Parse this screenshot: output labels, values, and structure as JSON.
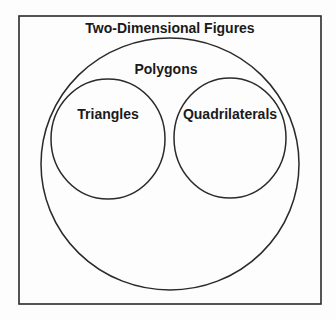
{
  "diagram": {
    "type": "venn",
    "universe": {
      "label": "Two-Dimensional Figures"
    },
    "sets": [
      {
        "label": "Polygons",
        "contains": [
          "Triangles",
          "Quadrilaterals"
        ]
      },
      {
        "label": "Triangles",
        "parent": "Polygons"
      },
      {
        "label": "Quadrilaterals",
        "parent": "Polygons"
      }
    ]
  },
  "colors": {
    "stroke": "#2a2a2a",
    "background": "#fdfdfd",
    "text": "#1a1a1a"
  }
}
